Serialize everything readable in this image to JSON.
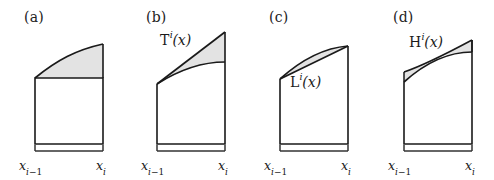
{
  "figure": {
    "background_color": "#ffffff",
    "stroke_color": "#1a1a1a",
    "shade_color": "#e0e0e0",
    "panel_count": 4
  },
  "axis": {
    "left_label_var": "x",
    "left_label_sub_index": "i",
    "left_label_sub_op": "−1",
    "right_label_var": "x",
    "right_label_sub_index": "i"
  },
  "panels": [
    {
      "tag": "(a)",
      "function_label": null,
      "function_label_base": null,
      "function_label_sup": null,
      "function_label_arg": "(x)",
      "description": "rectangle-rule-error",
      "shaded": true
    },
    {
      "tag": "(b)",
      "function_label": "T",
      "function_label_base": "T",
      "function_label_sup": "i",
      "function_label_arg": "(x)",
      "description": "tangent-line-error",
      "shaded": true
    },
    {
      "tag": "(c)",
      "function_label": "L",
      "function_label_base": "L",
      "function_label_sup": "i",
      "function_label_arg": "(x)",
      "description": "linear-interpolant-error",
      "shaded": true
    },
    {
      "tag": "(d)",
      "function_label": "H",
      "function_label_base": "H",
      "function_label_sup": "i",
      "function_label_arg": "(x)",
      "description": "hermite-interpolant-error",
      "shaded": true
    }
  ]
}
